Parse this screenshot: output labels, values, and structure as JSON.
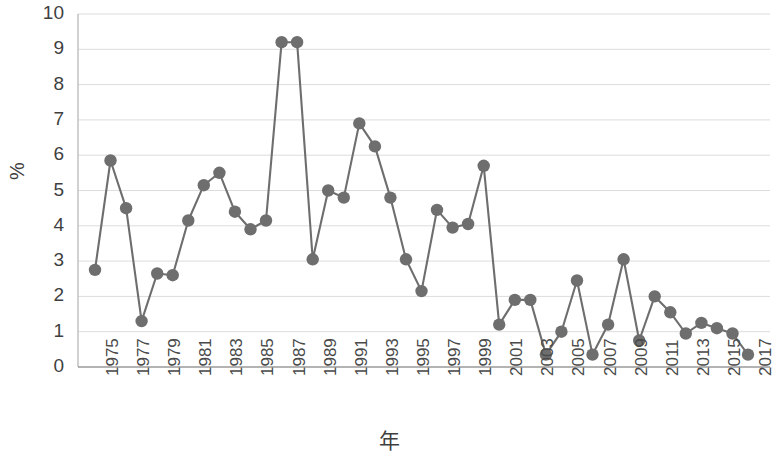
{
  "chart_data": {
    "type": "line",
    "title": "",
    "xlabel": "年",
    "ylabel": "%",
    "ylim": [
      0,
      10
    ],
    "yticks": [
      0,
      1,
      2,
      3,
      4,
      5,
      6,
      7,
      8,
      9,
      10
    ],
    "xticks": [
      "1975",
      "1977",
      "1979",
      "1981",
      "1983",
      "1985",
      "1987",
      "1989",
      "1991",
      "1993",
      "1995",
      "1997",
      "1999",
      "2001",
      "2003",
      "2005",
      "2007",
      "2009",
      "2011",
      "2013",
      "2015",
      "2017"
    ],
    "grid": true,
    "legend": "none",
    "marker": "circle",
    "series_color": "#6e6e6e",
    "x": [
      1975,
      1976,
      1977,
      1978,
      1979,
      1980,
      1981,
      1982,
      1983,
      1984,
      1985,
      1986,
      1987,
      1988,
      1989,
      1990,
      1991,
      1992,
      1993,
      1994,
      1995,
      1996,
      1997,
      1998,
      1999,
      2000,
      2001,
      2002,
      2003,
      2004,
      2005,
      2006,
      2007,
      2008,
      2009,
      2010,
      2011,
      2012,
      2013,
      2014,
      2015,
      2016,
      2017
    ],
    "values": [
      2.75,
      5.85,
      4.5,
      1.3,
      2.65,
      2.6,
      4.15,
      5.15,
      5.5,
      4.4,
      3.9,
      4.15,
      9.2,
      9.2,
      3.05,
      5.0,
      4.8,
      6.9,
      6.25,
      4.8,
      3.05,
      2.15,
      4.45,
      3.95,
      4.05,
      5.7,
      1.2,
      1.9,
      1.9,
      0.35,
      1.0,
      2.45,
      0.35,
      1.2,
      3.05,
      0.75,
      2.0,
      1.55,
      0.95,
      1.25,
      1.1,
      0.95,
      0.35
    ]
  }
}
